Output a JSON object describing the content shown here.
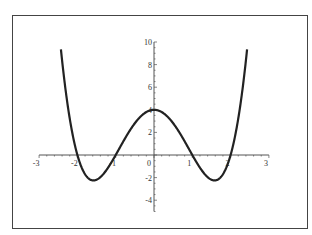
{
  "chart_data": {
    "type": "line",
    "title": "",
    "xlabel": "",
    "ylabel": "",
    "function": "y = x^4 - 5x^2 + 4",
    "xlim": [
      -3,
      3
    ],
    "ylim": [
      -5,
      10
    ],
    "x_ticks": [
      "-3",
      "-2",
      "-1",
      "0",
      "1",
      "2",
      "3"
    ],
    "y_ticks": [
      "-4",
      "-2",
      "0",
      "2",
      "4",
      "6",
      "8",
      "10"
    ],
    "grid": false,
    "legend": null,
    "series": [
      {
        "name": "curve",
        "x": [
          -2.43,
          -2.25,
          -2.0,
          -1.75,
          -1.58,
          -1.25,
          -1.0,
          -0.5,
          0,
          0.5,
          1.0,
          1.25,
          1.58,
          1.75,
          2.0,
          2.25,
          2.43
        ],
        "y": [
          9.35,
          4.31,
          0,
          -1.93,
          -2.25,
          -1.37,
          0,
          2.81,
          4,
          2.81,
          0,
          -1.37,
          -2.25,
          -1.93,
          0,
          4.31,
          9.35
        ]
      }
    ],
    "annotations": {
      "zeros": [
        -2,
        -1,
        1,
        2
      ],
      "local_max": [
        0,
        4
      ],
      "local_min": [
        [
          -1.58,
          -2.25
        ],
        [
          1.58,
          -2.25
        ]
      ]
    }
  },
  "colors": {
    "curve": "#222222",
    "axes": "#555555",
    "frame": "#444444",
    "text": "#333333"
  }
}
